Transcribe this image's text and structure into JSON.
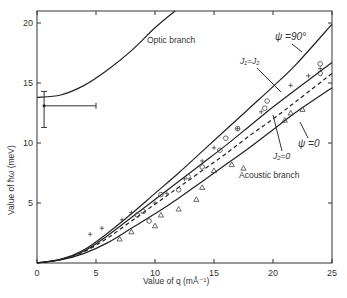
{
  "chart_data": {
    "type": "line",
    "title": "",
    "xlabel": "Value of q (mÅ⁻¹)",
    "ylabel": "Value of ħω (meV)",
    "xlim": [
      0,
      25
    ],
    "ylim": [
      0,
      21
    ],
    "xticks": [
      0,
      5,
      10,
      15,
      20,
      25
    ],
    "yticks": [
      5,
      10,
      15,
      20
    ],
    "grid": false,
    "legend": "none",
    "series": [
      {
        "name": "Optic branch",
        "style": "solid",
        "x": [
          0,
          2,
          4,
          6,
          8,
          10,
          11.7
        ],
        "y": [
          13.8,
          14.0,
          14.8,
          16.1,
          17.7,
          19.6,
          21.0
        ]
      },
      {
        "name": "ψ = 90°",
        "style": "solid",
        "x": [
          0,
          2,
          4,
          6,
          8,
          10,
          12,
          14,
          16,
          18,
          20,
          22,
          25
        ],
        "y": [
          0,
          0.3,
          1.1,
          2.5,
          4.1,
          5.8,
          7.5,
          9.3,
          11.1,
          12.9,
          14.7,
          16.6,
          19.9
        ]
      },
      {
        "name": "J1 = J2",
        "style": "solid",
        "x": [
          0,
          2,
          4,
          6,
          8,
          10,
          12,
          14,
          16,
          18,
          20,
          22,
          25
        ],
        "y": [
          0,
          0.3,
          1.0,
          2.3,
          3.8,
          5.3,
          6.8,
          8.3,
          9.8,
          11.4,
          13.0,
          14.5,
          16.7
        ]
      },
      {
        "name": "J2 = 0",
        "style": "dashed",
        "x": [
          0,
          2,
          4,
          6,
          8,
          10,
          12,
          14,
          16,
          18,
          20,
          22,
          25
        ],
        "y": [
          0,
          0.3,
          0.95,
          2.1,
          3.5,
          4.9,
          6.3,
          7.7,
          9.1,
          10.6,
          12.0,
          13.5,
          15.8
        ]
      },
      {
        "name": "ψ = 0",
        "style": "solid",
        "x": [
          0,
          2,
          4,
          6,
          8,
          10,
          12,
          14,
          16,
          18,
          20,
          22,
          25
        ],
        "y": [
          0,
          0.25,
          0.8,
          1.7,
          2.9,
          4.1,
          5.4,
          6.8,
          8.2,
          9.6,
          11.1,
          12.6,
          14.6
        ]
      }
    ],
    "error_point": {
      "x": 0.6,
      "y": 13.1,
      "y_err": [
        11.3,
        14.3
      ],
      "x_err": [
        0.6,
        5.0
      ]
    },
    "markers": {
      "plus": [
        [
          4.5,
          2.4
        ],
        [
          5.5,
          2.9
        ],
        [
          7.2,
          3.6
        ],
        [
          8,
          4.2
        ],
        [
          10,
          5.0
        ],
        [
          11,
          5.8
        ],
        [
          12.5,
          7.0
        ],
        [
          14,
          8.5
        ],
        [
          15,
          9.6
        ],
        [
          17,
          11.2
        ],
        [
          19,
          12.6
        ],
        [
          21.5,
          14.8
        ],
        [
          23,
          15.6
        ],
        [
          24,
          16.2
        ]
      ],
      "circle": [
        [
          8.5,
          4.0
        ],
        [
          9,
          4.3
        ],
        [
          9.5,
          3.5
        ],
        [
          10.5,
          5.7
        ],
        [
          12,
          6.1
        ],
        [
          12.8,
          7.2
        ],
        [
          14,
          8.0
        ],
        [
          15.5,
          9.4
        ],
        [
          16,
          10.4
        ],
        [
          17,
          11.2
        ],
        [
          19.3,
          12.9
        ],
        [
          19.5,
          13.5
        ],
        [
          24,
          16.6
        ],
        [
          24,
          15.8
        ]
      ],
      "triangle": [
        [
          7,
          2.0
        ],
        [
          8,
          2.6
        ],
        [
          10,
          3.1
        ],
        [
          10.5,
          4.0
        ],
        [
          12,
          4.5
        ],
        [
          13.5,
          5.3
        ],
        [
          14,
          6.3
        ],
        [
          15,
          7.7
        ],
        [
          16.5,
          8.2
        ],
        [
          17.5,
          7.9
        ],
        [
          21,
          11.9
        ],
        [
          21.5,
          12.5
        ],
        [
          22.5,
          12.8
        ]
      ]
    },
    "annotations": [
      "Optic branch",
      "ψ = 90°",
      "J1 = J2",
      "J2 = 0",
      "ψ = 0",
      "Acoustic branch"
    ]
  },
  "labels": {
    "optic": "Optic branch",
    "acoustic": "Acoustic branch",
    "psi90": "ψ =90°",
    "j1j2": "J₁=J₂",
    "j2zero": "J₂=0",
    "psi0": "ψ =0",
    "xlabel": "Value of q (mÅ⁻¹)",
    "ylabel": "Value of ħω (meV)"
  }
}
